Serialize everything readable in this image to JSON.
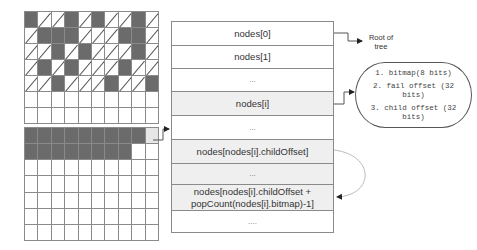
{
  "top_grid": {
    "rows": [
      [
        "D",
        "S",
        "S",
        "D",
        "S",
        "D",
        "S",
        "S",
        "D",
        "S"
      ],
      [
        "S",
        "D",
        "D",
        "D",
        "S",
        "S",
        "S",
        "D",
        "D",
        "S"
      ],
      [
        "S",
        "S",
        "D",
        "S",
        "D",
        "S",
        "S",
        "S",
        "D",
        "S"
      ],
      [
        "S",
        "D",
        "S",
        "D",
        "S",
        "S",
        "S",
        "D",
        "S",
        "S"
      ],
      [
        "S",
        "S",
        "D",
        "S",
        "S",
        "S",
        "D",
        "S",
        "S",
        "D"
      ],
      [
        "W",
        "W",
        "W",
        "W",
        "W",
        "W",
        "W",
        "W",
        "W",
        "W"
      ],
      [
        "W",
        "W",
        "W",
        "W",
        "W",
        "W",
        "W",
        "W",
        "W",
        "W"
      ]
    ]
  },
  "bottom_grid": {
    "rows": [
      [
        "D",
        "D",
        "D",
        "D",
        "D",
        "D",
        "D",
        "D",
        "D",
        "L"
      ],
      [
        "D",
        "D",
        "D",
        "D",
        "D",
        "D",
        "D",
        "D",
        "W",
        "W"
      ],
      [
        "W",
        "W",
        "W",
        "W",
        "W",
        "W",
        "W",
        "W",
        "W",
        "W"
      ],
      [
        "W",
        "W",
        "W",
        "W",
        "W",
        "W",
        "W",
        "W",
        "W",
        "W"
      ],
      [
        "W",
        "W",
        "W",
        "W",
        "W",
        "W",
        "W",
        "W",
        "W",
        "W"
      ],
      [
        "W",
        "W",
        "W",
        "W",
        "W",
        "W",
        "W",
        "W",
        "W",
        "W"
      ],
      [
        "W",
        "W",
        "W",
        "W",
        "W",
        "W",
        "W",
        "W",
        "W",
        "W"
      ]
    ]
  },
  "nodes_table": {
    "rows": [
      {
        "label": "nodes[0]",
        "shaded": false
      },
      {
        "label": "nodes[1]",
        "shaded": false
      },
      {
        "label": "...",
        "shaded": false
      },
      {
        "label": "nodes[i]",
        "shaded": true
      },
      {
        "label": "...",
        "shaded": false
      },
      {
        "label": "nodes[nodes[i].childOffset]",
        "shaded": true
      },
      {
        "label": "...",
        "shaded": true
      },
      {
        "label_line1": "nodes[nodes[i].childOffset +",
        "label_line2": "popCount(nodes[i].bitmap)-1]",
        "shaded": true
      },
      {
        "label": "....",
        "shaded": false
      }
    ]
  },
  "root_label": {
    "line1": "Root of",
    "line2": "tree"
  },
  "node_fields": [
    {
      "line1": "1. bitmap(8 bits)"
    },
    {
      "line1": "2. fail offset (32",
      "line2": "bits)"
    },
    {
      "line1": "3. child offset (32",
      "line2": "bits)"
    }
  ],
  "colors": {
    "dark_cell": "#6b6b6b",
    "highlight_cell": "#e6e6e6",
    "shaded_row": "#efefef",
    "line": "#8a8a8a"
  }
}
